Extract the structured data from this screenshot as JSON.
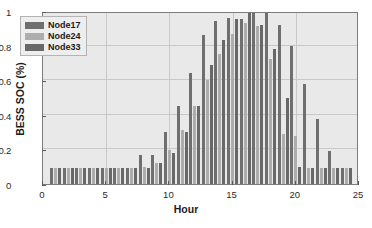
{
  "chart_data": {
    "type": "bar",
    "title": "",
    "xlabel": "Hour",
    "ylabel": "BESS SOC (%)",
    "xlim": [
      0,
      25
    ],
    "ylim": [
      0,
      1
    ],
    "grid": true,
    "legend_position": "upper-left",
    "categories": [
      1,
      2,
      3,
      4,
      5,
      6,
      7,
      8,
      9,
      10,
      11,
      12,
      13,
      14,
      15,
      16,
      17,
      18,
      19,
      20,
      21,
      22,
      23,
      24
    ],
    "xticks": [
      0,
      5,
      10,
      15,
      20,
      25
    ],
    "yticks": [
      0,
      0.2,
      0.4,
      0.6,
      0.8,
      1
    ],
    "xtick_labels": [
      "0",
      "5",
      "10",
      "15",
      "20",
      "25"
    ],
    "ytick_labels": [
      "0",
      "0.2",
      "0.4",
      "0.6",
      "0.8",
      "1"
    ],
    "series": [
      {
        "name": "Node17",
        "color": "#6f6f6f",
        "values": [
          0.09,
          0.09,
          0.09,
          0.09,
          0.09,
          0.09,
          0.09,
          0.17,
          0.17,
          0.3,
          0.45,
          0.64,
          0.86,
          0.94,
          0.96,
          0.955,
          1.0,
          1.0,
          0.92,
          0.8,
          0.58,
          0.375,
          0.19,
          0.09
        ]
      },
      {
        "name": "Node24",
        "color": "#adadad",
        "values": [
          0.09,
          0.09,
          0.09,
          0.09,
          0.09,
          0.09,
          0.09,
          0.1,
          0.12,
          0.195,
          0.31,
          0.45,
          0.6,
          0.75,
          0.87,
          0.93,
          0.915,
          0.72,
          0.29,
          0.28,
          0.095,
          0.09,
          0.09,
          0.09
        ]
      },
      {
        "name": "Node33",
        "color": "#686868",
        "values": [
          0.09,
          0.09,
          0.09,
          0.09,
          0.09,
          0.09,
          0.09,
          0.09,
          0.12,
          0.18,
          0.3,
          0.45,
          0.69,
          0.83,
          0.955,
          1.0,
          0.92,
          0.78,
          0.5,
          0.1,
          0.09,
          0.09,
          0.09,
          0.09
        ]
      }
    ]
  },
  "legend": {
    "items": [
      {
        "label": "Node17"
      },
      {
        "label": "Node24"
      },
      {
        "label": "Node33"
      }
    ]
  },
  "axes": {
    "x_title": "Hour",
    "y_title": "BESS SOC (%)"
  }
}
